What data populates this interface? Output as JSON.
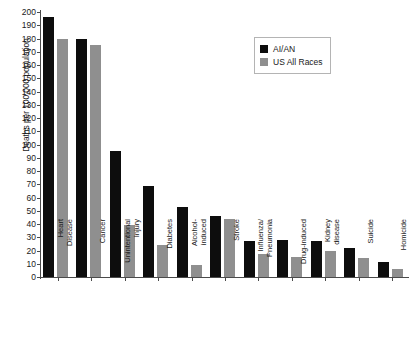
{
  "chart_data": {
    "type": "bar",
    "title": "",
    "subtitle": "",
    "xlabel": "",
    "ylabel": "Deaths per 100,000 population",
    "ylim": [
      0,
      200
    ],
    "ytick_step": 10,
    "yticks": [
      200,
      190,
      180,
      170,
      160,
      150,
      140,
      130,
      120,
      110,
      100,
      90,
      80,
      70,
      60,
      50,
      40,
      30,
      20,
      10,
      0
    ],
    "grid": false,
    "legend_position": "top-right",
    "categories": [
      "Heart Disease",
      "Cancer",
      "Unintentional Injury",
      "Diabetes",
      "Alcohol-induced",
      "Stroke",
      "Influenza/Pneumonia",
      "Drug-induced",
      "Kidney disease",
      "Suicide",
      "Homicide"
    ],
    "category_lines": [
      [
        "Heart",
        "Disease"
      ],
      [
        "Cancer",
        ""
      ],
      [
        "Unintentional",
        "Injury"
      ],
      [
        "Diabetes",
        ""
      ],
      [
        "Alcohol-",
        "induced"
      ],
      [
        "Stroke",
        ""
      ],
      [
        "Influenza/",
        "Pneumonia"
      ],
      [
        "Drug-induced",
        ""
      ],
      [
        "Kidney",
        "disease"
      ],
      [
        "Suicide",
        ""
      ],
      [
        "Homicide",
        ""
      ]
    ],
    "series": [
      {
        "name": "AI/AN",
        "color": "#0d0d0d",
        "values": [
          196,
          180,
          95,
          69,
          53,
          46,
          27,
          28,
          27,
          22,
          11
        ]
      },
      {
        "name": "US All Races",
        "color": "#8f8f8f",
        "values": [
          180,
          175,
          39,
          24,
          9,
          44,
          17,
          15,
          20,
          14,
          6
        ]
      }
    ]
  },
  "legend": {
    "entries": [
      {
        "label": "AI/AN",
        "color": "#0d0d0d"
      },
      {
        "label": "US All Races",
        "color": "#8f8f8f"
      }
    ]
  },
  "axes": {
    "y_title": "Deaths per 100,000 population"
  }
}
